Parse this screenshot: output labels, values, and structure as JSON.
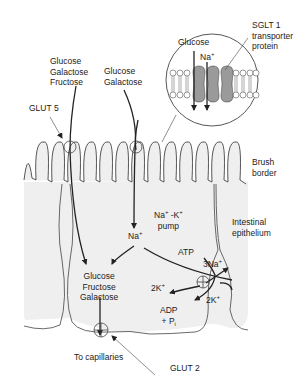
{
  "diagram": {
    "labels": {
      "sglt1_line1": "SGLT 1",
      "sglt1_line2": "transporter",
      "sglt1_line3": "protein",
      "inset_glucose": "Glucose",
      "inset_na": "Na",
      "inset_na_sup": "+",
      "left_sugars": [
        "Glucose",
        "Galactose",
        "Fructose"
      ],
      "mid_sugars": [
        "Glucose",
        "Galactose"
      ],
      "glut5": "GLUT 5",
      "brush_border_1": "Brush",
      "brush_border_2": "border",
      "pump_1": "Na",
      "pump_1_sup": "+",
      "pump_2": " -K",
      "pump_2_sup": "+",
      "pump_3": "pump",
      "epithelium_1": "Intestinal",
      "epithelium_2": "epithelium",
      "cell_na": "Na",
      "cell_na_sup": "+",
      "atp": "ATP",
      "three_na": "3Na",
      "three_na_sup": "+",
      "two_k_left": "2K",
      "two_k_left_sup": "+",
      "two_k_right": "2K",
      "two_k_right_sup": "+",
      "adp": "ADP",
      "pi": "+ P",
      "pi_sub": "i",
      "cell_sugars": [
        "Glucose",
        "Fructose",
        "Galactose"
      ],
      "to_capillaries": "To capillaries",
      "glut2": "GLUT 2"
    },
    "colors": {
      "cell_fill": "#efefef",
      "line": "#333333",
      "protein": "#9a9a9a",
      "text": "#222222"
    }
  }
}
